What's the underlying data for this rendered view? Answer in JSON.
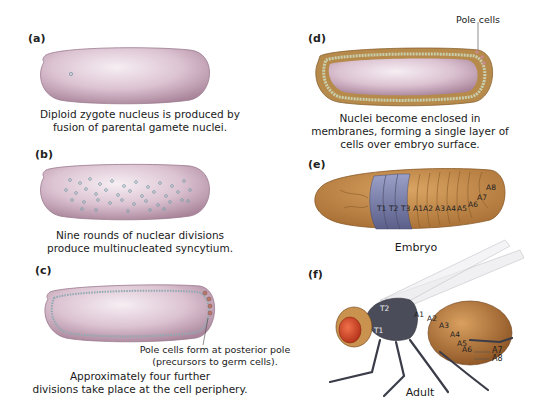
{
  "panels": {
    "a": {
      "label": "(a)",
      "caption_line1": "Diploid zygote nucleus is produced by",
      "caption_line2": "fusion of parental gamete nuclei."
    },
    "b": {
      "label": "(b)",
      "caption_line1": "Nine rounds of nuclear divisions",
      "caption_line2": "produce multinucleated syncytium."
    },
    "c": {
      "label": "(c)",
      "callout_line1": "Pole cells form at posterior pole",
      "callout_line2": "(precursors to germ cells).",
      "caption_line1": "Approximately four further",
      "caption_line2": "divisions take place at the cell periphery."
    },
    "d": {
      "label": "(d)",
      "callout": "Pole cells",
      "caption_line1": "Nuclei become enclosed in",
      "caption_line2": "membranes, forming a single layer of",
      "caption_line3": "cells over embryo surface."
    },
    "e": {
      "label": "(e)",
      "caption": "Embryo",
      "segments": [
        "T1",
        "T2",
        "T3",
        "A1",
        "A2",
        "A3",
        "A4",
        "A5",
        "A6",
        "A7",
        "A8"
      ]
    },
    "f": {
      "label": "(f)",
      "caption": "Adult",
      "segments": [
        "T1",
        "T2",
        "A1",
        "A2",
        "A3",
        "A4",
        "A5",
        "A6"
      ],
      "callouts": [
        "A7",
        "A8"
      ]
    }
  },
  "colors": {
    "egg": "#d9bfcf",
    "egg_highlight": "#f3eaf0",
    "nucleus": "#8fa9b0",
    "pole_cells": "#b7776a",
    "blastoderm": "#b68a4a",
    "embryo_body": "#c8904f",
    "thoracic_segments": "#7b80a8",
    "fly_body": "#4a4c5a",
    "fly_eye": "#d2472a",
    "fly_abdomen": "#b87a3a"
  }
}
